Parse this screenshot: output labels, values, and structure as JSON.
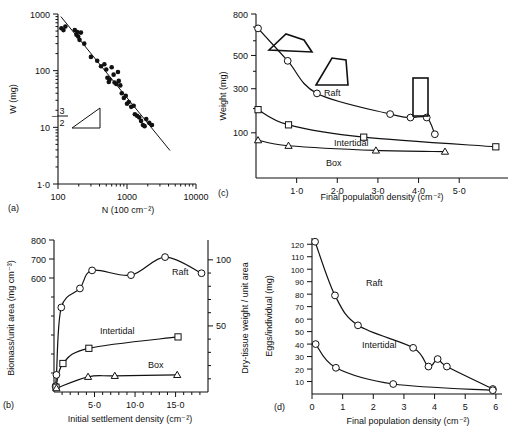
{
  "figure": {
    "panels": [
      "a",
      "b",
      "c",
      "d"
    ],
    "panel_labels": {
      "a": "(a)",
      "b": "(b)",
      "c": "(c)",
      "d": "(d)"
    }
  },
  "chart_data": [
    {
      "id": "a",
      "type": "scatter",
      "title": "",
      "xlabel": "N (100 cm⁻²)",
      "ylabel": "W (mg)",
      "xscale": "log",
      "yscale": "log",
      "xlim": [
        100,
        10000
      ],
      "ylim": [
        1,
        1000
      ],
      "xticks": [
        100,
        1000,
        10000
      ],
      "xtick_labels": [
        "100",
        "1000",
        "10000"
      ],
      "yticks": [
        1,
        10,
        100,
        1000
      ],
      "ytick_labels": [
        "1·0",
        "10",
        "100",
        "1000"
      ],
      "annotation": "-3/2",
      "annotation_numerator": "3",
      "annotation_denominator": "2",
      "annotation_minus": "–",
      "fit_line": {
        "slope": -1.5,
        "x1": 110,
        "y1": 900,
        "x2": 4200,
        "y2": 3.9
      },
      "points": [
        {
          "x": 112,
          "y": 560
        },
        {
          "x": 120,
          "y": 520
        },
        {
          "x": 128,
          "y": 600
        },
        {
          "x": 175,
          "y": 520
        },
        {
          "x": 185,
          "y": 430
        },
        {
          "x": 190,
          "y": 480
        },
        {
          "x": 196,
          "y": 400
        },
        {
          "x": 205,
          "y": 350
        },
        {
          "x": 215,
          "y": 470
        },
        {
          "x": 240,
          "y": 300
        },
        {
          "x": 300,
          "y": 175
        },
        {
          "x": 370,
          "y": 150
        },
        {
          "x": 420,
          "y": 120
        },
        {
          "x": 470,
          "y": 130
        },
        {
          "x": 500,
          "y": 105
        },
        {
          "x": 520,
          "y": 75
        },
        {
          "x": 545,
          "y": 63
        },
        {
          "x": 560,
          "y": 70
        },
        {
          "x": 600,
          "y": 115
        },
        {
          "x": 640,
          "y": 85
        },
        {
          "x": 660,
          "y": 62
        },
        {
          "x": 700,
          "y": 58
        },
        {
          "x": 740,
          "y": 95
        },
        {
          "x": 760,
          "y": 66
        },
        {
          "x": 800,
          "y": 55
        },
        {
          "x": 840,
          "y": 40
        },
        {
          "x": 900,
          "y": 33
        },
        {
          "x": 960,
          "y": 36
        },
        {
          "x": 1000,
          "y": 26
        },
        {
          "x": 1060,
          "y": 28
        },
        {
          "x": 1150,
          "y": 23
        },
        {
          "x": 1250,
          "y": 24
        },
        {
          "x": 1300,
          "y": 17
        },
        {
          "x": 1400,
          "y": 16
        },
        {
          "x": 1500,
          "y": 15
        },
        {
          "x": 1600,
          "y": 13
        },
        {
          "x": 1700,
          "y": 11
        },
        {
          "x": 1800,
          "y": 10.5
        },
        {
          "x": 1900,
          "y": 14
        },
        {
          "x": 2100,
          "y": 12
        },
        {
          "x": 2300,
          "y": 11
        }
      ]
    },
    {
      "id": "b",
      "type": "scatter",
      "title": "",
      "xlabel": "Initial settlement density (cm⁻²)",
      "ylabel": "Biomass/unit area (mg cm⁻³)",
      "ylabel_right": "Dry-tissue weight / unit area",
      "xlim": [
        0,
        19
      ],
      "ylim": [
        0,
        800
      ],
      "xticks": [
        5,
        10,
        15
      ],
      "xtick_labels": [
        "5·0",
        "10·0",
        "15·0"
      ],
      "xticks_minor": [
        1,
        2,
        3,
        4,
        6,
        7,
        8,
        9,
        11,
        12,
        13,
        14,
        16,
        17,
        18
      ],
      "yticks": [
        600,
        700,
        800
      ],
      "ytick_labels": [
        "600",
        "700",
        "800"
      ],
      "yticks_minor": [
        100,
        200,
        300,
        400,
        500
      ],
      "yticks_right": [
        50,
        100
      ],
      "ytick_labels_right": [
        "50",
        "100"
      ],
      "yticks_right_minor": [
        10,
        20,
        30,
        40,
        60,
        70,
        80,
        90
      ],
      "ylim_right": [
        0,
        115
      ],
      "series": [
        {
          "name": "Raft",
          "marker": "circle-open",
          "points": [
            {
              "x": 0.2,
              "y": 30
            },
            {
              "x": 0.3,
              "y": 90
            },
            {
              "x": 0.9,
              "y": 445
            },
            {
              "x": 3.2,
              "y": 545
            },
            {
              "x": 4.7,
              "y": 640
            },
            {
              "x": 9.5,
              "y": 615
            },
            {
              "x": 13.7,
              "y": 710
            },
            {
              "x": 18.2,
              "y": 625
            }
          ]
        },
        {
          "name": "Intertidal",
          "marker": "square-open",
          "points": [
            {
              "x": 0.25,
              "y": 25
            },
            {
              "x": 1.1,
              "y": 150
            },
            {
              "x": 4.3,
              "y": 230
            },
            {
              "x": 15.3,
              "y": 290
            }
          ]
        },
        {
          "name": "Box",
          "marker": "triangle-open",
          "points": [
            {
              "x": 0.3,
              "y": 20
            },
            {
              "x": 4.2,
              "y": 80
            },
            {
              "x": 7.5,
              "y": 85
            },
            {
              "x": 15.2,
              "y": 90
            }
          ]
        }
      ]
    },
    {
      "id": "c",
      "type": "scatter",
      "title": "",
      "xlabel": "Final population density (cm⁻²)",
      "ylabel": "Weight (mg)",
      "xlim": [
        0,
        6.2
      ],
      "ylim": [
        0,
        800
      ],
      "xticks": [
        1,
        2,
        3,
        4,
        5
      ],
      "xtick_labels": [
        "1·0",
        "2·0",
        "3·0",
        "4·0",
        "5·0"
      ],
      "yticks": [
        100,
        300,
        500,
        800
      ],
      "ytick_labels": [
        "100",
        "300",
        "500",
        "800"
      ],
      "yticks_minor": [
        200,
        400,
        600,
        700
      ],
      "shell_shapes": [
        "wide-flat-shell",
        "trapezoid-shell",
        "narrow-tall-shell"
      ],
      "series": [
        {
          "name": "Raft",
          "marker": "circle-open",
          "points": [
            {
              "x": 0.05,
              "y": 690
            },
            {
              "x": 0.78,
              "y": 465
            },
            {
              "x": 1.5,
              "y": 275
            },
            {
              "x": 3.3,
              "y": 175
            },
            {
              "x": 3.8,
              "y": 160
            },
            {
              "x": 4.2,
              "y": 160
            },
            {
              "x": 4.4,
              "y": 95
            }
          ]
        },
        {
          "name": "Intertidal",
          "marker": "square-open",
          "points": [
            {
              "x": 0.05,
              "y": 195
            },
            {
              "x": 0.8,
              "y": 130
            },
            {
              "x": 2.65,
              "y": 85
            },
            {
              "x": 5.9,
              "y": 55
            }
          ]
        },
        {
          "name": "Box",
          "marker": "triangle-open",
          "points": [
            {
              "x": 0.05,
              "y": 75
            },
            {
              "x": 0.8,
              "y": 58
            },
            {
              "x": 2.95,
              "y": 45
            },
            {
              "x": 4.65,
              "y": 42
            }
          ]
        }
      ]
    },
    {
      "id": "d",
      "type": "scatter",
      "title": "",
      "xlabel": "Final population density (cm⁻²)",
      "ylabel": "Eggs/individual (mg)",
      "xlim": [
        0,
        6.2
      ],
      "ylim": [
        0,
        125
      ],
      "xticks": [
        0,
        1,
        2,
        3,
        4,
        5,
        6
      ],
      "xtick_labels": [
        "0",
        "1",
        "2",
        "3",
        "4",
        "5",
        "6"
      ],
      "yticks": [
        10,
        20,
        30,
        40,
        50,
        60,
        70,
        80,
        90,
        100,
        110,
        120
      ],
      "ytick_labels": [
        "10",
        "20",
        "30",
        "40",
        "50",
        "60",
        "70",
        "80",
        "90",
        "100",
        "110",
        "120"
      ],
      "series": [
        {
          "name": "Raft",
          "marker": "circle-open",
          "points": [
            {
              "x": 0.1,
              "y": 122
            },
            {
              "x": 0.75,
              "y": 79
            },
            {
              "x": 1.5,
              "y": 55
            },
            {
              "x": 3.3,
              "y": 37
            },
            {
              "x": 3.8,
              "y": 22
            },
            {
              "x": 4.1,
              "y": 28
            },
            {
              "x": 4.4,
              "y": 22
            },
            {
              "x": 5.9,
              "y": 4
            }
          ]
        },
        {
          "name": "Intertidal",
          "marker": "circle-open",
          "points": [
            {
              "x": 0.12,
              "y": 40
            },
            {
              "x": 0.78,
              "y": 21
            },
            {
              "x": 2.65,
              "y": 8
            },
            {
              "x": 5.9,
              "y": 3
            }
          ]
        }
      ]
    }
  ]
}
